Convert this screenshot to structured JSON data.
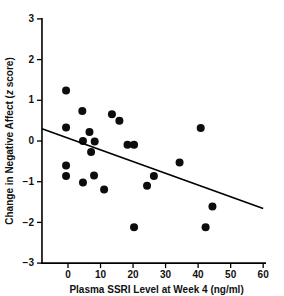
{
  "chart_data": {
    "type": "scatter",
    "title": "",
    "xlabel": "Plasma SSRI Level at Week 4 (ng/ml)",
    "ylabel": "Change in Negative Affect (z score)",
    "ylabel_parts": {
      "main": "Change in Negative Affect (",
      "italic": "z",
      "tail": " score)"
    },
    "xlim": [
      -8,
      60
    ],
    "ylim": [
      -3,
      3
    ],
    "xticks": [
      0,
      10,
      20,
      30,
      40,
      50,
      60
    ],
    "xtick_labels": [
      "0",
      "10",
      "20",
      "30",
      "40",
      "50",
      "60"
    ],
    "yticks": [
      3,
      2,
      1,
      0,
      -1,
      -2,
      -3
    ],
    "ytick_labels": [
      "3",
      "2",
      "1",
      "0",
      "−1",
      "−2",
      "−3"
    ],
    "grid": false,
    "legend": "none",
    "marker": "filled-circle",
    "marker_color": "#0d0d0d",
    "marker_size_px": 5.4,
    "points": [
      {
        "x": -0.6,
        "y": 1.24
      },
      {
        "x": 4.4,
        "y": 0.74
      },
      {
        "x": -0.6,
        "y": 0.33
      },
      {
        "x": 13.5,
        "y": 0.66
      },
      {
        "x": 15.8,
        "y": 0.5
      },
      {
        "x": 40.8,
        "y": 0.32
      },
      {
        "x": 6.6,
        "y": 0.22
      },
      {
        "x": 4.6,
        "y": 0.0
      },
      {
        "x": 8.2,
        "y": -0.01
      },
      {
        "x": 18.3,
        "y": -0.09
      },
      {
        "x": 20.3,
        "y": -0.09
      },
      {
        "x": 7.1,
        "y": -0.27
      },
      {
        "x": 34.3,
        "y": -0.53
      },
      {
        "x": -0.6,
        "y": -0.6
      },
      {
        "x": 8.0,
        "y": -0.85
      },
      {
        "x": 26.4,
        "y": -0.86
      },
      {
        "x": -0.6,
        "y": -0.86
      },
      {
        "x": 4.6,
        "y": -1.02
      },
      {
        "x": 24.3,
        "y": -1.1
      },
      {
        "x": 11.1,
        "y": -1.19
      },
      {
        "x": 44.4,
        "y": -1.61
      },
      {
        "x": 20.3,
        "y": -2.12
      },
      {
        "x": 42.3,
        "y": -2.12
      }
    ],
    "trend_line": {
      "x_start": -8,
      "y_start": 0.3,
      "x_end": 60,
      "y_end": -1.66,
      "color": "#000000"
    }
  }
}
